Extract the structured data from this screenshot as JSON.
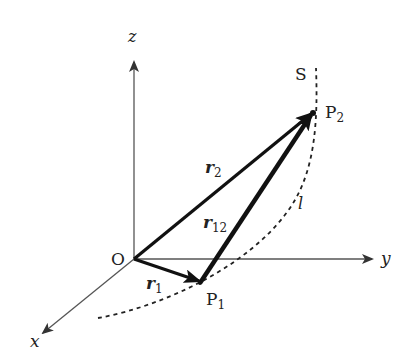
{
  "diagram": {
    "axes": {
      "x": {
        "label": "x"
      },
      "y": {
        "label": "y"
      },
      "z": {
        "label": "z"
      }
    },
    "points": {
      "origin": {
        "label": "O"
      },
      "p1": {
        "label": "P",
        "sub": "1"
      },
      "p2": {
        "label": "P",
        "sub": "2"
      }
    },
    "vectors": {
      "r1": {
        "label": "r",
        "sub": "1"
      },
      "r2": {
        "label": "r",
        "sub": "2"
      },
      "r12": {
        "label": "r",
        "sub": "12"
      }
    },
    "curve": {
      "name": "S",
      "path_label": "l"
    },
    "colors": {
      "ink": "#1a1a1a",
      "axis": "#555555",
      "background": "#ffffff"
    }
  }
}
